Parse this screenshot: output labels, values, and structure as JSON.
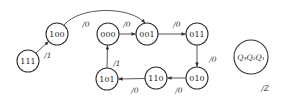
{
  "diagram": {
    "type": "state-transition-diagram",
    "states": [
      {
        "id": "s111",
        "label": "111",
        "cx": 28,
        "cy": 61
      },
      {
        "id": "s100",
        "label": "100",
        "cx": 57,
        "cy": 34
      },
      {
        "id": "s000",
        "label": "000",
        "cx": 108,
        "cy": 34
      },
      {
        "id": "s001",
        "label": "001",
        "cx": 147,
        "cy": 34
      },
      {
        "id": "s011",
        "label": "011",
        "cx": 197,
        "cy": 34
      },
      {
        "id": "s010",
        "label": "010",
        "cx": 197,
        "cy": 78
      },
      {
        "id": "s110",
        "label": "110",
        "cx": 156,
        "cy": 78
      },
      {
        "id": "s101",
        "label": "101",
        "cx": 107,
        "cy": 79
      }
    ],
    "transitions": [
      {
        "from": "111",
        "to": "100",
        "label": "/1"
      },
      {
        "from": "100",
        "to": "001",
        "label": "/0"
      },
      {
        "from": "000",
        "to": "001",
        "label": "/0"
      },
      {
        "from": "001",
        "to": "011",
        "label": "/0"
      },
      {
        "from": "011",
        "to": "010",
        "label": "/0"
      },
      {
        "from": "010",
        "to": "110",
        "label": "/0"
      },
      {
        "from": "110",
        "to": "101",
        "label": "/0"
      },
      {
        "from": "101",
        "to": "000",
        "label": "/1"
      }
    ],
    "legend": {
      "state_label_html": "Q₃Q₂Q₁",
      "output_label": "/Z"
    }
  }
}
